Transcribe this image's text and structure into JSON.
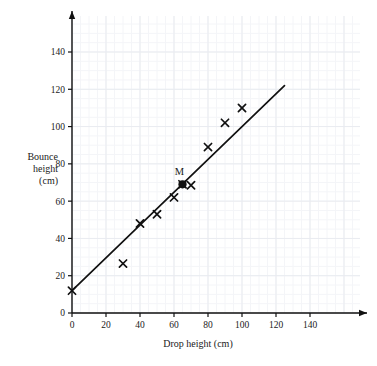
{
  "chart_data": {
    "type": "scatter",
    "title": "",
    "xlabel": "Drop height (cm)",
    "ylabel": "Bounce height (cm)",
    "ylabel_lines": [
      "Bounce",
      "height",
      "(cm)"
    ],
    "xlim": [
      0,
      150
    ],
    "ylim": [
      0,
      155
    ],
    "xticks": [
      0,
      20,
      40,
      60,
      80,
      100,
      120,
      140
    ],
    "yticks": [
      0,
      20,
      40,
      60,
      80,
      100,
      120,
      140
    ],
    "xtick_labels": [
      "0",
      "20",
      "40",
      "60",
      "80",
      "100",
      "120",
      "140"
    ],
    "ytick_labels": [
      "0",
      "20",
      "40",
      "60",
      "80",
      "100",
      "120",
      "140"
    ],
    "grid": true,
    "grid_major_step": 20,
    "grid_minor_step": 5,
    "grid_color": "#e9ebf0",
    "grid_minor_color": "#f4f5f8",
    "axis_color": "#111111",
    "marker_color": "#111111",
    "line_color": "#111111",
    "legend": null,
    "points": [
      {
        "x": 0,
        "y": 12,
        "marker": "x"
      },
      {
        "x": 30,
        "y": 26.5,
        "marker": "x"
      },
      {
        "x": 40,
        "y": 48,
        "marker": "x"
      },
      {
        "x": 50,
        "y": 53,
        "marker": "x"
      },
      {
        "x": 60,
        "y": 62,
        "marker": "x"
      },
      {
        "x": 65,
        "y": 69,
        "marker": "x"
      },
      {
        "x": 70,
        "y": 68.5,
        "marker": "x"
      },
      {
        "x": 80,
        "y": 89,
        "marker": "x"
      },
      {
        "x": 90,
        "y": 102,
        "marker": "x"
      },
      {
        "x": 100,
        "y": 110,
        "marker": "x"
      }
    ],
    "mean_point": {
      "x": 65,
      "y": 69,
      "label": "M",
      "marker": "filled-circle"
    },
    "trend_line": {
      "x_start": 0,
      "y_start": 12,
      "x_end": 125,
      "y_end": 122,
      "label": "line-of-best-fit"
    }
  }
}
